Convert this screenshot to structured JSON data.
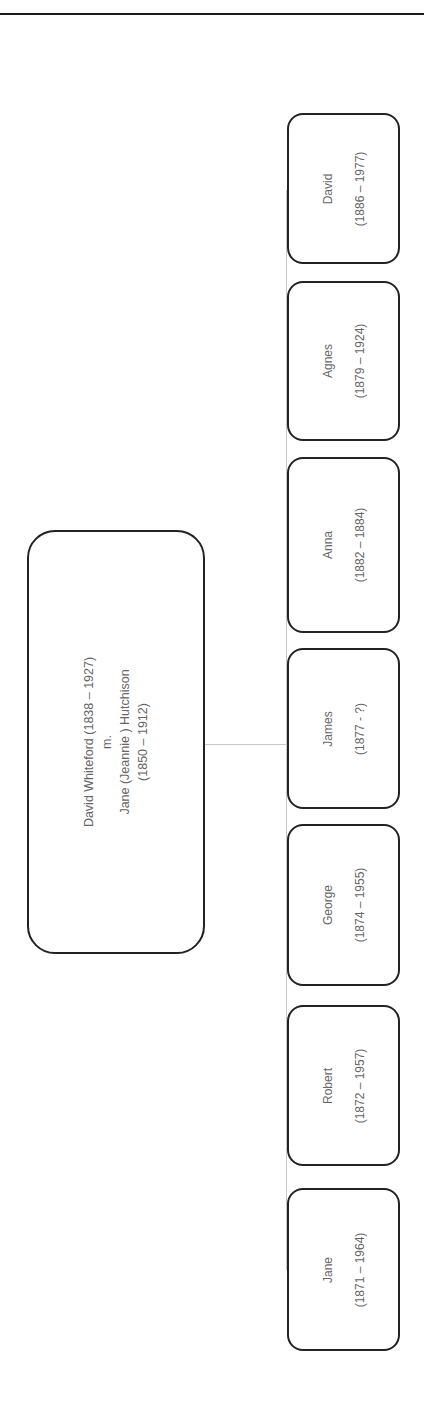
{
  "parent": {
    "line1": "David Whiteford (1838 – 1927)",
    "line2": "m.",
    "line3": "Jane (Jeannie ) Hutchison",
    "line4": "(1850 – 1912)"
  },
  "children": [
    {
      "name": "David",
      "dates": "(1886 – 1977)"
    },
    {
      "name": "Agnes",
      "dates": "(1879 – 1924)"
    },
    {
      "name": "Anna",
      "dates": "(1882 – 1884)"
    },
    {
      "name": "James",
      "dates": "(1877 - ?)"
    },
    {
      "name": "George",
      "dates": "(1874 – 1955)"
    },
    {
      "name": "Robert",
      "dates": "(1872 – 1957)"
    },
    {
      "name": "Jane",
      "dates": "(1871 – 1964)"
    }
  ]
}
